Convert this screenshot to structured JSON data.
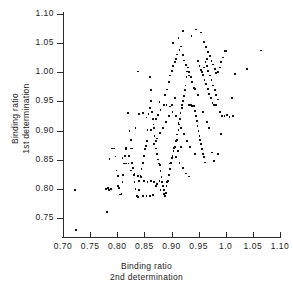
{
  "chart_data": {
    "type": "scatter",
    "title": "",
    "xlabel": "Binding ratio 2nd determination",
    "ylabel": "Binding ratio 1st determination",
    "xlabel_lines": [
      "Binding ratio",
      "2nd  determination"
    ],
    "ylabel_lines": [
      "Binding ratio",
      "1st determination"
    ],
    "xlim": [
      0.7,
      1.1
    ],
    "ylim": [
      0.715,
      1.1
    ],
    "grid": false,
    "legend": null,
    "xticks": [
      0.7,
      0.75,
      0.8,
      0.85,
      0.9,
      0.95,
      1.0,
      1.05,
      1.1
    ],
    "xticklabels": [
      "0.70",
      "0.75",
      "0.80",
      "0.85",
      "0.90",
      "0.95",
      "1.0",
      "1.05",
      "1.10"
    ],
    "yticks": [
      0.75,
      0.8,
      0.85,
      0.9,
      0.95,
      1.0,
      1.05,
      1.1
    ],
    "yticklabels": [
      "0.75",
      "0.80",
      "0.85",
      "0.90",
      "0.95",
      "1.00",
      "1.05",
      "1.10"
    ],
    "marker": "square",
    "marker_color": "#111111",
    "n_points": 238,
    "points": [
      [
        0.72,
        0.8
      ],
      [
        0.722,
        0.731
      ],
      [
        0.779,
        0.762
      ],
      [
        0.778,
        0.801
      ],
      [
        0.781,
        0.803
      ],
      [
        0.783,
        0.8
      ],
      [
        0.786,
        0.802
      ],
      [
        0.784,
        0.853
      ],
      [
        0.789,
        0.871
      ],
      [
        0.792,
        0.871
      ],
      [
        0.795,
        0.857
      ],
      [
        0.797,
        0.833
      ],
      [
        0.799,
        0.824
      ],
      [
        0.8,
        0.806
      ],
      [
        0.802,
        0.803
      ],
      [
        0.803,
        0.792
      ],
      [
        0.806,
        0.793
      ],
      [
        0.808,
        0.813
      ],
      [
        0.809,
        0.826
      ],
      [
        0.81,
        0.845
      ],
      [
        0.812,
        0.858
      ],
      [
        0.814,
        0.869
      ],
      [
        0.815,
        0.872
      ],
      [
        0.818,
        0.932
      ],
      [
        0.821,
        0.901
      ],
      [
        0.823,
        0.885
      ],
      [
        0.824,
        0.871
      ],
      [
        0.826,
        0.846
      ],
      [
        0.828,
        0.838
      ],
      [
        0.829,
        0.826
      ],
      [
        0.83,
        0.814
      ],
      [
        0.832,
        0.802
      ],
      [
        0.834,
        0.789
      ],
      [
        0.836,
        0.788
      ],
      [
        0.838,
        0.8
      ],
      [
        0.839,
        0.815
      ],
      [
        0.841,
        0.824
      ],
      [
        0.843,
        0.836
      ],
      [
        0.845,
        0.845
      ],
      [
        0.846,
        0.846
      ],
      [
        0.848,
        0.858
      ],
      [
        0.849,
        0.87
      ],
      [
        0.851,
        0.875
      ],
      [
        0.853,
        0.884
      ],
      [
        0.854,
        0.902
      ],
      [
        0.856,
        0.93
      ],
      [
        0.858,
        0.941
      ],
      [
        0.859,
        0.993
      ],
      [
        0.861,
        0.952
      ],
      [
        0.862,
        0.934
      ],
      [
        0.864,
        0.922
      ],
      [
        0.866,
        0.906
      ],
      [
        0.867,
        0.893
      ],
      [
        0.869,
        0.884
      ],
      [
        0.87,
        0.871
      ],
      [
        0.872,
        0.862
      ],
      [
        0.874,
        0.852
      ],
      [
        0.875,
        0.845
      ],
      [
        0.877,
        0.843
      ],
      [
        0.878,
        0.832
      ],
      [
        0.88,
        0.822
      ],
      [
        0.881,
        0.814
      ],
      [
        0.883,
        0.806
      ],
      [
        0.884,
        0.793
      ],
      [
        0.886,
        0.789
      ],
      [
        0.888,
        0.795
      ],
      [
        0.889,
        0.806
      ],
      [
        0.89,
        0.814
      ],
      [
        0.892,
        0.815
      ],
      [
        0.893,
        0.826
      ],
      [
        0.895,
        0.836
      ],
      [
        0.896,
        0.845
      ],
      [
        0.897,
        0.846
      ],
      [
        0.899,
        0.855
      ],
      [
        0.9,
        0.858
      ],
      [
        0.902,
        0.866
      ],
      [
        0.903,
        0.872
      ],
      [
        0.905,
        0.874
      ],
      [
        0.906,
        0.884
      ],
      [
        0.908,
        0.886
      ],
      [
        0.909,
        0.895
      ],
      [
        0.911,
        0.903
      ],
      [
        0.912,
        0.912
      ],
      [
        0.914,
        0.921
      ],
      [
        0.915,
        0.932
      ],
      [
        0.917,
        0.941
      ],
      [
        0.918,
        0.945
      ],
      [
        0.92,
        0.952
      ],
      [
        0.921,
        0.961
      ],
      [
        0.923,
        0.971
      ],
      [
        0.924,
        0.979
      ],
      [
        0.926,
        0.994
      ],
      [
        0.927,
        1.003
      ],
      [
        0.836,
        1.003
      ],
      [
        0.861,
        0.971
      ],
      [
        0.876,
        0.951
      ],
      [
        0.887,
        0.962
      ],
      [
        0.89,
        0.972
      ],
      [
        0.893,
        0.985
      ],
      [
        0.896,
        0.996
      ],
      [
        0.899,
        1.004
      ],
      [
        0.901,
        1.012
      ],
      [
        0.904,
        1.019
      ],
      [
        0.906,
        1.024
      ],
      [
        0.909,
        1.032
      ],
      [
        0.913,
        1.04
      ],
      [
        0.916,
        1.046
      ],
      [
        0.919,
        1.031
      ],
      [
        0.922,
        1.022
      ],
      [
        0.925,
        1.014
      ],
      [
        0.928,
        1.01
      ],
      [
        0.931,
        1.002
      ],
      [
        0.934,
        0.993
      ],
      [
        0.936,
        0.985
      ],
      [
        0.939,
        0.975
      ],
      [
        0.931,
        0.946
      ],
      [
        0.934,
        0.946
      ],
      [
        0.936,
        0.944
      ],
      [
        0.939,
        0.944
      ],
      [
        0.941,
        0.935
      ],
      [
        0.943,
        0.926
      ],
      [
        0.945,
        0.918
      ],
      [
        0.946,
        0.909
      ],
      [
        0.948,
        0.901
      ],
      [
        0.95,
        0.893
      ],
      [
        0.951,
        0.885
      ],
      [
        0.953,
        0.878
      ],
      [
        0.955,
        0.87
      ],
      [
        0.956,
        0.862
      ],
      [
        0.958,
        0.856
      ],
      [
        0.96,
        0.847
      ],
      [
        0.941,
        0.862
      ],
      [
        0.933,
        0.874
      ],
      [
        0.927,
        0.884
      ],
      [
        0.921,
        0.896
      ],
      [
        0.916,
        0.906
      ],
      [
        0.911,
        0.915
      ],
      [
        0.906,
        0.926
      ],
      [
        0.9,
        0.934
      ],
      [
        0.895,
        0.943
      ],
      [
        0.889,
        0.946
      ],
      [
        0.884,
        0.945
      ],
      [
        0.878,
        0.937
      ],
      [
        0.873,
        0.928
      ],
      [
        0.869,
        0.921
      ],
      [
        0.865,
        0.912
      ],
      [
        0.86,
        0.903
      ],
      [
        0.901,
        1.052
      ],
      [
        0.911,
        1.061
      ],
      [
        0.92,
        1.073
      ],
      [
        0.935,
        1.064
      ],
      [
        0.944,
        1.075
      ],
      [
        0.952,
        1.07
      ],
      [
        0.958,
        1.053
      ],
      [
        0.962,
        1.045
      ],
      [
        0.966,
        1.037
      ],
      [
        0.969,
        1.029
      ],
      [
        0.972,
        1.021
      ],
      [
        0.975,
        1.015
      ],
      [
        0.978,
        1.007
      ],
      [
        0.981,
        1.001
      ],
      [
        0.984,
        1.002
      ],
      [
        0.987,
        1.01
      ],
      [
        0.99,
        1.019
      ],
      [
        0.993,
        1.027
      ],
      [
        0.996,
        1.038
      ],
      [
        0.999,
        1.038
      ],
      [
        0.963,
        1.012
      ],
      [
        0.966,
        1.004
      ],
      [
        0.969,
        0.996
      ],
      [
        0.972,
        0.988
      ],
      [
        0.975,
        0.979
      ],
      [
        0.978,
        0.971
      ],
      [
        0.981,
        0.963
      ],
      [
        0.984,
        0.955
      ],
      [
        0.955,
        1.002
      ],
      [
        0.958,
        1.01
      ],
      [
        0.961,
        1.019
      ],
      [
        0.964,
        1.024
      ],
      [
        0.947,
        1.021
      ],
      [
        0.95,
        1.013
      ],
      [
        0.953,
        1.005
      ],
      [
        0.956,
        0.997
      ],
      [
        0.959,
        0.989
      ],
      [
        0.962,
        0.981
      ],
      [
        0.965,
        0.973
      ],
      [
        0.968,
        0.965
      ],
      [
        0.971,
        0.957
      ],
      [
        0.974,
        0.949
      ],
      [
        0.977,
        0.945
      ],
      [
        0.98,
        0.945
      ],
      [
        0.988,
        0.934
      ],
      [
        0.992,
        0.926
      ],
      [
        0.996,
        0.927
      ],
      [
        1.0,
        0.929
      ],
      [
        1.005,
        0.925
      ],
      [
        1.01,
        0.957
      ],
      [
        1.012,
        0.926
      ],
      [
        1.015,
        0.999
      ],
      [
        1.038,
        1.007
      ],
      [
        1.063,
        1.039
      ],
      [
        0.99,
        0.896
      ],
      [
        0.984,
        0.862
      ],
      [
        0.977,
        0.85
      ],
      [
        0.973,
        0.864
      ],
      [
        0.968,
        0.906
      ],
      [
        0.963,
        0.916
      ],
      [
        0.957,
        0.933
      ],
      [
        0.947,
        0.963
      ],
      [
        0.941,
        0.973
      ],
      [
        0.935,
        0.984
      ],
      [
        0.93,
        0.996
      ],
      [
        0.926,
        1.003
      ],
      [
        0.905,
        0.957
      ],
      [
        0.899,
        0.946
      ],
      [
        0.894,
        0.927
      ],
      [
        0.888,
        0.916
      ],
      [
        0.882,
        0.906
      ],
      [
        0.877,
        0.897
      ],
      [
        0.871,
        0.888
      ],
      [
        0.866,
        0.878
      ],
      [
        0.852,
        0.924
      ],
      [
        0.845,
        0.932
      ],
      [
        0.839,
        0.93
      ],
      [
        0.832,
        0.906
      ],
      [
        0.826,
        0.871
      ],
      [
        0.82,
        0.858
      ],
      [
        0.814,
        0.845
      ],
      [
        0.808,
        0.855
      ],
      [
        0.819,
        0.845
      ],
      [
        0.824,
        0.833
      ],
      [
        0.83,
        0.827
      ],
      [
        0.836,
        0.824
      ],
      [
        0.842,
        0.822
      ],
      [
        0.848,
        0.815
      ],
      [
        0.854,
        0.813
      ],
      [
        0.86,
        0.815
      ],
      [
        0.866,
        0.814
      ],
      [
        0.872,
        0.81
      ],
      [
        0.878,
        0.8
      ],
      [
        0.884,
        0.799
      ],
      [
        0.846,
        0.789
      ],
      [
        0.852,
        0.79
      ],
      [
        0.858,
        0.789
      ],
      [
        0.864,
        0.791
      ],
      [
        0.87,
        0.806
      ],
      [
        0.876,
        0.815
      ],
      [
        0.906,
        0.856
      ],
      [
        0.913,
        0.846
      ],
      [
        0.919,
        0.837
      ],
      [
        0.925,
        0.828
      ],
      [
        0.931,
        0.823
      ],
      [
        0.91,
        0.866
      ],
      [
        0.916,
        0.874
      ]
    ]
  }
}
